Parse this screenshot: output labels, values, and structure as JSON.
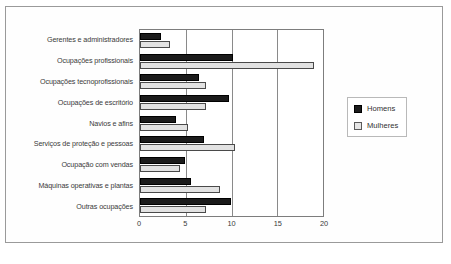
{
  "chart_data": {
    "type": "bar",
    "orientation": "horizontal",
    "title": "",
    "xlabel": "",
    "ylabel": "",
    "xlim": [
      0,
      20
    ],
    "xticks": [
      0,
      5,
      10,
      15,
      20
    ],
    "grid": true,
    "legend_position": "right",
    "categories": [
      "Gerentes e administradores",
      "Ocupações profissionais",
      "Ocupações tecnoprofissionais",
      "Ocupações de escritório",
      "Navios e afins",
      "Serviços de proteção e pessoas",
      "Ocupação com vendas",
      "Máquinas operativas e plantas",
      "Outras ocupações"
    ],
    "series": [
      {
        "name": "Homens",
        "color": "#1b1b1b",
        "values": [
          2.3,
          10.2,
          6.4,
          9.7,
          3.9,
          7.0,
          4.9,
          5.6,
          9.9
        ]
      },
      {
        "name": "Mulheres",
        "color": "#e2e2e2",
        "values": [
          3.3,
          19.0,
          7.2,
          7.2,
          5.2,
          10.4,
          4.4,
          8.7,
          7.2
        ]
      }
    ]
  },
  "caption": ""
}
